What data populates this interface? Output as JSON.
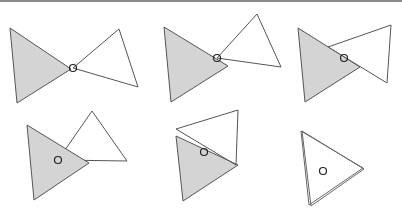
{
  "figure": {
    "colors": {
      "gray_fill": "#d4d4d4",
      "stroke": "#555555",
      "white_fill": "#ffffff",
      "rule": "#8a8a8a"
    },
    "panels": [
      {
        "id": 1,
        "gray": "10,28 17,103 71,69",
        "white": "73,68 119,29 138,87",
        "white_on_top": false,
        "pivot": {
          "cx": 73,
          "cy": 68,
          "r": 3.5
        }
      },
      {
        "id": 2,
        "gray": "164,27 171,102 228,66",
        "white": "217,58 257,14 281,67",
        "white_on_top": false,
        "pivot": {
          "cx": 217,
          "cy": 58,
          "r": 3.5
        }
      },
      {
        "id": 3,
        "gray": "298,28 305,102 360,67",
        "white": "328,47 391,25 387,83",
        "white_on_top": false,
        "pivot": {
          "cx": 344,
          "cy": 58,
          "r": 3.5
        }
      },
      {
        "id": 4,
        "gray": "27,125 34,200 89,163",
        "white": "58,160 92,111 127,161",
        "white_on_top": false,
        "pivot": {
          "cx": 58,
          "cy": 160,
          "r": 3.5
        }
      },
      {
        "id": 5,
        "gray": "176,136 183,201 238,165",
        "white": "176,129 238,110 236,165",
        "white_on_top": true,
        "pivot": {
          "cx": 204,
          "cy": 152,
          "r": 3.5
        }
      },
      {
        "id": 6,
        "gray": "",
        "outline_a": "301,131 309,205 363,168",
        "outline_b": "302,131 311,206 364,169",
        "pivot": {
          "cx": 323,
          "cy": 171,
          "r": 3.5
        }
      }
    ]
  }
}
